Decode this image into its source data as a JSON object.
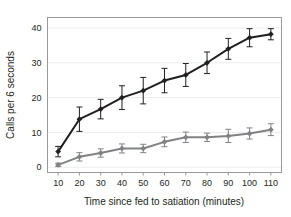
{
  "chart_data": {
    "type": "line",
    "title": "",
    "xlabel": "Time since fed to satiation (minutes)",
    "ylabel": "Calls per 6 seconds",
    "x": [
      10,
      20,
      30,
      40,
      50,
      60,
      70,
      80,
      90,
      100,
      110
    ],
    "xtick_labels": [
      "10",
      "20",
      "30",
      "40",
      "50",
      "60",
      "70",
      "80",
      "90",
      "100",
      "110"
    ],
    "ytick_labels": [
      "0",
      "10",
      "20",
      "30",
      "40"
    ],
    "yticks": [
      0,
      10,
      20,
      30,
      40
    ],
    "xlim": [
      5,
      115
    ],
    "ylim": [
      -1.5,
      43
    ],
    "grid": "horizontal",
    "legend_position": "none",
    "series": [
      {
        "name": "dark-series",
        "color": "#231f20",
        "marker": "diamond",
        "values": [
          4.5,
          13.8,
          16.7,
          20.0,
          22.0,
          24.9,
          26.5,
          30.0,
          34.0,
          37.2,
          38.2
        ],
        "errors": [
          1.5,
          3.5,
          2.8,
          3.4,
          3.8,
          3.5,
          3.3,
          3.1,
          3.0,
          2.6,
          1.6
        ]
      },
      {
        "name": "gray-series",
        "color": "#808285",
        "marker": "diamond",
        "values": [
          0.7,
          3.0,
          4.1,
          5.4,
          5.4,
          7.3,
          8.6,
          8.6,
          9.0,
          9.7,
          10.8
        ],
        "errors": [
          0.5,
          1.2,
          1.2,
          1.3,
          1.2,
          1.4,
          1.5,
          1.2,
          1.9,
          1.6,
          1.7
        ]
      }
    ]
  },
  "axes": {
    "ylabel": "Calls per 6 seconds",
    "xlabel": "Time since fed to satiation (minutes)"
  },
  "colors": {
    "dark_series": "#231f20",
    "gray_series": "#808285",
    "gridline": "#eceded",
    "border": "#9a9a9a",
    "text": "#231f20",
    "background": "#ffffff"
  }
}
